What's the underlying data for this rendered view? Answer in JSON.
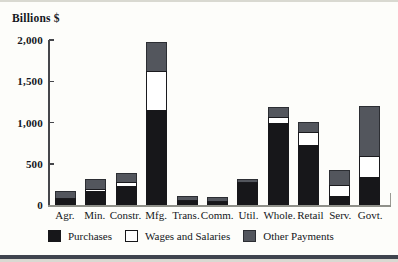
{
  "page": {
    "top_rule_color": "#d9d9d1",
    "bottom_rule_color": "#3f444e",
    "background": "#fdfdfa"
  },
  "chart_data": {
    "type": "bar",
    "stacked": true,
    "ylabel": "Billions $",
    "ylim": [
      0,
      2000
    ],
    "yticks": [
      2000,
      1500,
      1000,
      500,
      0
    ],
    "ytick_labels": [
      "2,000",
      "1,500",
      "1,000",
      "500",
      "0"
    ],
    "grid": false,
    "legend_position": "bottom",
    "categories": [
      "Agr.",
      "Min.",
      "Constr.",
      "Mfg.",
      "Trans.",
      "Comm.",
      "Util.",
      "Whole.",
      "Retail",
      "Serv.",
      "Govt."
    ],
    "series": [
      {
        "name": "Purchases",
        "color": "#17171a",
        "values": [
          70,
          170,
          235,
          1150,
          50,
          35,
          270,
          1000,
          730,
          110,
          345
        ]
      },
      {
        "name": "Wages and Salaries",
        "color": "#ffffff",
        "values": [
          20,
          20,
          50,
          475,
          15,
          10,
          15,
          70,
          150,
          130,
          255
        ]
      },
      {
        "name": "Other Payments",
        "color": "#53565d",
        "values": [
          85,
          120,
          100,
          350,
          50,
          45,
          35,
          120,
          130,
          180,
          600
        ]
      }
    ],
    "totals": [
      175,
      310,
      385,
      1975,
      115,
      90,
      320,
      1190,
      1010,
      420,
      1200
    ]
  }
}
